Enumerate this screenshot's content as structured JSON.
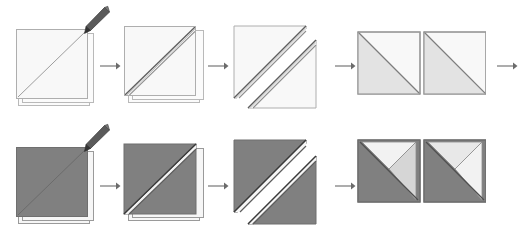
{
  "figure": {
    "background_color": "#ffffff",
    "rows": [
      {
        "id": "row-top",
        "napkin_color_name": "white",
        "napkin_color": "#f8f8f8",
        "napkin_edge_color": "#aeaeae",
        "steps": [
          {
            "index": 1,
            "name": "flat-square-with-diagonal-crease",
            "label": "Step 1",
            "has_pen": true,
            "pen_color": "#5a5a5a"
          },
          {
            "index": 2,
            "name": "single-diagonal-fold",
            "label": "Step 2",
            "has_pen": false
          },
          {
            "index": 3,
            "name": "double-diagonal-fold",
            "label": "Step 3",
            "has_pen": false
          },
          {
            "index": 4,
            "name": "two-folded-squares-result",
            "label": "Step 4",
            "has_pen": false
          }
        ],
        "arrows": [
          {
            "name": "arrow-step1-to-step2",
            "direction": "right",
            "glyph": "→"
          },
          {
            "name": "arrow-step2-to-step3",
            "direction": "right",
            "glyph": "→"
          },
          {
            "name": "arrow-step3-to-step4",
            "direction": "right",
            "glyph": "→"
          },
          {
            "name": "arrow-row-continue",
            "direction": "right",
            "glyph": "→"
          }
        ]
      },
      {
        "id": "row-bottom",
        "napkin_color_name": "grey",
        "napkin_color": "#808080",
        "napkin_edge_color": "#6f6f6f",
        "steps": [
          {
            "index": 1,
            "name": "flat-square-with-diagonal-crease",
            "label": "Step 1",
            "has_pen": true,
            "pen_color": "#5a5a5a"
          },
          {
            "index": 2,
            "name": "single-diagonal-fold",
            "label": "Step 2",
            "has_pen": false
          },
          {
            "index": 3,
            "name": "double-diagonal-fold",
            "label": "Step 3",
            "has_pen": false
          },
          {
            "index": 4,
            "name": "two-folded-squares-result",
            "label": "Step 4",
            "has_pen": false
          }
        ],
        "arrows": [
          {
            "name": "arrow-step1-to-step2",
            "direction": "right",
            "glyph": "→"
          },
          {
            "name": "arrow-step2-to-step3",
            "direction": "right",
            "glyph": "→"
          },
          {
            "name": "arrow-step3-to-step4",
            "direction": "right",
            "glyph": "→"
          }
        ]
      }
    ],
    "colors": {
      "white_napkin_face": "#f8f8f8",
      "white_napkin_shade": "#e3e3e3",
      "grey_napkin_face": "#808080",
      "grey_napkin_shade": "#8e8e8e",
      "grey_napkin_light": "#d8d8d8",
      "outline": "#aeaeae",
      "crease_line": "#8c8c8c",
      "arrow": "#6b6b6b",
      "pen_body": "#5a5a5a",
      "pen_tip": "#3b3b3b",
      "under_sheet": "#fbfbfb"
    }
  }
}
